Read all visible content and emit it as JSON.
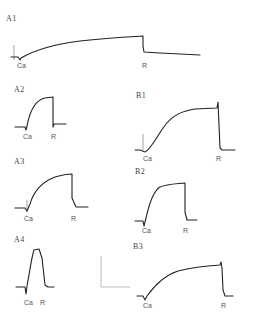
{
  "figure": {
    "panels": [
      {
        "id": "A1",
        "label": "A1",
        "stimulus_label": "Ca",
        "removal_label": "R"
      },
      {
        "id": "A2",
        "label": "A2",
        "stimulus_label": "Ca",
        "removal_label": "R"
      },
      {
        "id": "A3",
        "label": "A3",
        "stimulus_label": "Ca",
        "removal_label": "R"
      },
      {
        "id": "A4",
        "label": "A4",
        "stimulus_label": "Ca",
        "removal_label": "R"
      },
      {
        "id": "B1",
        "label": "B1",
        "stimulus_label": "Ca",
        "removal_label": "R"
      },
      {
        "id": "B2",
        "label": "B2",
        "stimulus_label": "Ca",
        "removal_label": "R"
      },
      {
        "id": "B3",
        "label": "B3",
        "stimulus_label": "Ca",
        "removal_label": "R"
      }
    ],
    "scale_bar": {
      "present": true
    },
    "trace_color": "#222222"
  }
}
